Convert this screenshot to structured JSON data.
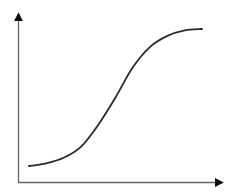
{
  "chart_data": {
    "type": "line",
    "title": "",
    "xlabel": "",
    "ylabel": "",
    "x": [
      0,
      0.1,
      0.2,
      0.3,
      0.4,
      0.5,
      0.6,
      0.7,
      0.8,
      0.9,
      1.0
    ],
    "series": [
      {
        "name": "sigmoid",
        "values": [
          0.0,
          0.02,
          0.06,
          0.14,
          0.3,
          0.5,
          0.72,
          0.87,
          0.95,
          0.99,
          1.0
        ]
      }
    ],
    "xlim": [
      0,
      1
    ],
    "ylim": [
      0,
      1
    ],
    "grid": false,
    "legend": "none",
    "colors": {
      "curve": "#2a2a2a",
      "axes": "#555555"
    }
  }
}
